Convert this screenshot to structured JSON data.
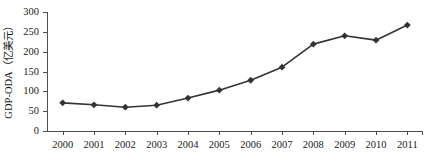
{
  "chart_data": {
    "type": "line",
    "title": "",
    "xlabel": "",
    "ylabel": "GDP-ODA（亿美元）",
    "categories": [
      "2000",
      "2001",
      "2002",
      "2003",
      "2004",
      "2005",
      "2006",
      "2007",
      "2008",
      "2009",
      "2010",
      "2011"
    ],
    "values": [
      71,
      66,
      60,
      65,
      83,
      103,
      128,
      161,
      219,
      240,
      229,
      267
    ],
    "series": [
      {
        "name": "GDP-ODA",
        "values": [
          71,
          66,
          60,
          65,
          83,
          103,
          128,
          161,
          219,
          240,
          229,
          267
        ]
      }
    ],
    "ylim": [
      0,
      300
    ],
    "yticks": [
      0,
      50,
      100,
      150,
      200,
      250,
      300
    ],
    "ytick_labels": [
      "0",
      "50",
      "100",
      "150",
      "200",
      "250",
      "300"
    ],
    "xtick_labels": [
      "2000",
      "2001",
      "2002",
      "2003",
      "2004",
      "2005",
      "2006",
      "2007",
      "2008",
      "2009",
      "2010",
      "2011"
    ],
    "grid": false,
    "legend": false,
    "marker": "diamond",
    "line_color": "#333333",
    "marker_color": "#333333",
    "axis_color": "#4d4d4d"
  }
}
